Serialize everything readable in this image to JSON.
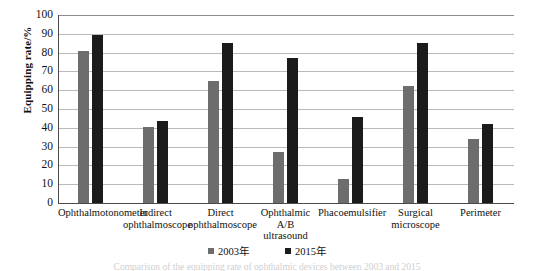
{
  "chart_data": {
    "type": "bar",
    "title": "",
    "xlabel": "",
    "ylabel": "Equipping rate/%",
    "ylim": [
      0,
      100
    ],
    "y_ticks": [
      100,
      90,
      80,
      70,
      60,
      50,
      40,
      30,
      20,
      10,
      0
    ],
    "grid": true,
    "legend_position": "bottom",
    "categories": [
      "Ophthalmotonometer",
      "Indirect\nophthalmoscope",
      "Direct\nophthalmoscope",
      "Ophthalmic\nA/B\nultrasound",
      "Phacoemulsifier",
      "Surgical\nmicroscope",
      "Perimeter"
    ],
    "series": [
      {
        "name": "2003年",
        "color": "#6d6d6d",
        "values": [
          81,
          40.5,
          65,
          27,
          13,
          62,
          34
        ]
      },
      {
        "name": "2015年",
        "color": "#1b1b1b",
        "values": [
          89.5,
          43.5,
          85,
          77,
          46,
          85,
          42
        ]
      }
    ]
  },
  "axis": {
    "y_title": "Equipping rate/%"
  },
  "caption": {
    "text": "Comparison of the equipping rate of ophthalmic devices between 2003 and 2015"
  },
  "colors": {
    "series_2003": "#6d6d6d",
    "series_2015": "#1b1b1b",
    "gridline": "#b9b9b9",
    "axis": "#4a4a4a",
    "background": "#ffffff"
  }
}
